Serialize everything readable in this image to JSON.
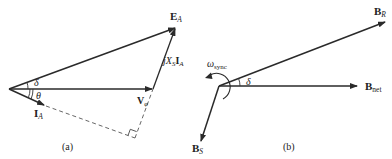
{
  "diagram_a": {
    "caption": "(a)",
    "labels": {
      "E": "E",
      "E_sub": "A",
      "jXsIa_j": "jX",
      "jXsIa_sub": "S",
      "jXsIa_I": "I",
      "jXsIa_sub2": "A",
      "V": "V",
      "V_sub": "φ",
      "I": "I",
      "I_sub": "A",
      "delta": "δ",
      "theta": "θ"
    }
  },
  "diagram_b": {
    "caption": "(b)",
    "labels": {
      "BR": "B",
      "BR_sub": "R",
      "Bnet": "B",
      "Bnet_sub": "net",
      "BS": "B",
      "BS_sub": "S",
      "omega": "ω",
      "omega_sub": "sync",
      "delta": "δ"
    }
  },
  "colors": {
    "stroke": "#2a2a2a",
    "text": "#222222"
  }
}
